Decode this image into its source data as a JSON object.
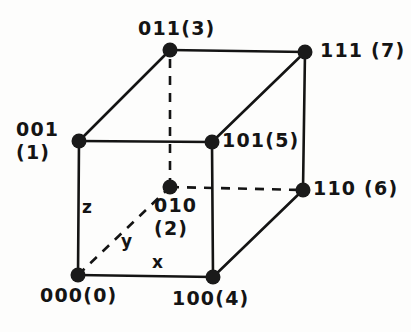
{
  "figure": {
    "type": "3-bit-binary-cube-diagram",
    "background_color": "#fdfdfc",
    "ink_color": "#141414"
  },
  "vertices": [
    {
      "id": "v000",
      "label_line1": "000(0)",
      "label_line2": "",
      "code": "000",
      "decimal": "(0)",
      "x": 78,
      "y": 275
    },
    {
      "id": "v001",
      "label_line1": "001",
      "label_line2": "(1)",
      "code": "001",
      "decimal": "(1)",
      "x": 79,
      "y": 141
    },
    {
      "id": "v010",
      "label_line1": "010",
      "label_line2": "(2)",
      "code": "010",
      "decimal": "(2)",
      "x": 170,
      "y": 187
    },
    {
      "id": "v011",
      "label_line1": "011(3)",
      "label_line2": "",
      "code": "011",
      "decimal": "(3)",
      "x": 170,
      "y": 50
    },
    {
      "id": "v100",
      "label_line1": "100(4)",
      "label_line2": "",
      "code": "100",
      "decimal": "(4)",
      "x": 213,
      "y": 277
    },
    {
      "id": "v101",
      "label_line1": "101(5)",
      "label_line2": "",
      "code": "101",
      "decimal": "(5)",
      "x": 212,
      "y": 142
    },
    {
      "id": "v110",
      "label_line1": "110 (6)",
      "label_line2": "",
      "code": "110",
      "decimal": "(6)",
      "x": 303,
      "y": 190
    },
    {
      "id": "v111",
      "label_line1": "111 (7)",
      "label_line2": "",
      "code": "111",
      "decimal": "(7)",
      "x": 305,
      "y": 52
    }
  ],
  "axes": [
    {
      "id": "axis-z",
      "label": "z",
      "x": 82,
      "y": 199
    },
    {
      "id": "axis-y",
      "label": "y",
      "x": 121,
      "y": 233
    },
    {
      "id": "axis-x",
      "label": "x",
      "x": 152,
      "y": 254
    }
  ],
  "label_positions": {
    "v000": {
      "x": 40,
      "y": 284
    },
    "v001": {
      "x": 16,
      "y": 118
    },
    "v010": {
      "x": 154,
      "y": 194
    },
    "v011": {
      "x": 138,
      "y": 17
    },
    "v100": {
      "x": 172,
      "y": 287
    },
    "v101": {
      "x": 222,
      "y": 129
    },
    "v110": {
      "x": 313,
      "y": 177
    },
    "v111": {
      "x": 320,
      "y": 39
    }
  },
  "edges": [
    {
      "id": "e-000-001",
      "from": "v000",
      "to": "v001",
      "style": "solid"
    },
    {
      "id": "e-000-100",
      "from": "v000",
      "to": "v100",
      "style": "solid"
    },
    {
      "id": "e-000-010",
      "from": "v000",
      "to": "v010",
      "style": "dashed"
    },
    {
      "id": "e-001-011",
      "from": "v001",
      "to": "v011",
      "style": "solid"
    },
    {
      "id": "e-001-101",
      "from": "v001",
      "to": "v101",
      "style": "solid"
    },
    {
      "id": "e-010-011",
      "from": "v010",
      "to": "v011",
      "style": "dashed"
    },
    {
      "id": "e-010-110",
      "from": "v010",
      "to": "v110",
      "style": "dashed"
    },
    {
      "id": "e-011-111",
      "from": "v011",
      "to": "v111",
      "style": "solid"
    },
    {
      "id": "e-100-101",
      "from": "v100",
      "to": "v101",
      "style": "solid"
    },
    {
      "id": "e-100-110",
      "from": "v100",
      "to": "v110",
      "style": "solid"
    },
    {
      "id": "e-101-111",
      "from": "v101",
      "to": "v111",
      "style": "solid"
    },
    {
      "id": "e-110-111",
      "from": "v110",
      "to": "v111",
      "style": "solid"
    }
  ]
}
